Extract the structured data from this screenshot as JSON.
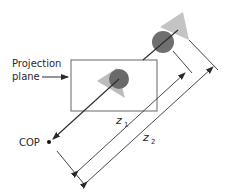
{
  "diagram": {
    "labels": {
      "projection_plane_line1": "Projection",
      "projection_plane_line2": "plane",
      "cop": "COP",
      "z1_main": "z",
      "z1_sub": "1",
      "z2_main": "z",
      "z2_sub": "2"
    },
    "colors": {
      "line": "#2a2a2a",
      "sphere": "#6f6f6f",
      "triangle": "#bdbdbd",
      "plane_border": "#555555",
      "background": "#ffffff"
    }
  }
}
